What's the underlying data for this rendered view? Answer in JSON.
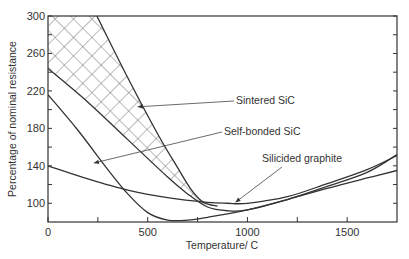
{
  "chart_data": {
    "type": "line",
    "title": "",
    "xlabel": "Temperature/ C",
    "ylabel": "Percentage of nominal resistance",
    "xlim": [
      0,
      1750
    ],
    "ylim": [
      80,
      300
    ],
    "x_ticks": [
      0,
      500,
      1000,
      1500
    ],
    "x_minor_ticks": [
      250,
      750,
      1250
    ],
    "y_ticks": [
      100,
      140,
      180,
      220,
      260,
      300
    ],
    "y_minor_ticks": [
      120,
      160,
      200,
      240,
      280
    ],
    "grid": false,
    "legend": "none",
    "series": [
      {
        "name": "Sintered SiC (lower bound)",
        "x": [
          0,
          200,
          400,
          600,
          700,
          800,
          900,
          1000,
          1200,
          1400,
          1600,
          1750
        ],
        "y": [
          244,
          208,
          168,
          128,
          110,
          96,
          92,
          93,
          104,
          118,
          133,
          152
        ]
      },
      {
        "name": "Sintered SiC (upper bound)",
        "x": [
          245,
          400,
          550,
          650,
          720,
          780,
          850
        ],
        "y": [
          300,
          234,
          174,
          138,
          114,
          101,
          97
        ]
      },
      {
        "name": "Self-bonded SiC",
        "x": [
          0,
          150,
          300,
          400,
          500,
          600,
          700,
          800,
          1000,
          1200,
          1400,
          1600,
          1750
        ],
        "y": [
          216,
          178,
          136,
          110,
          90,
          82,
          82,
          85,
          93,
          104,
          116,
          127,
          135
        ]
      },
      {
        "name": "Silicided graphite",
        "x": [
          0,
          200,
          400,
          600,
          800,
          900,
          1000,
          1200,
          1400,
          1600,
          1750
        ],
        "y": [
          140,
          126,
          114,
          106,
          101,
          100,
          100,
          107,
          121,
          136,
          151
        ]
      }
    ],
    "shaded_region": {
      "name": "Sintered SiC",
      "pattern": "cross-hatch",
      "between": [
        "Sintered SiC (lower bound)",
        "Sintered SiC (upper bound)"
      ]
    },
    "annotations": [
      {
        "text": "Sintered SiC",
        "arrow_to": [
          450,
          203
        ]
      },
      {
        "text": "Self-bonded SiC",
        "arrow_to": [
          230,
          143
        ]
      },
      {
        "text": "Silicided graphite",
        "arrow_to": [
          940,
          101
        ]
      }
    ]
  }
}
